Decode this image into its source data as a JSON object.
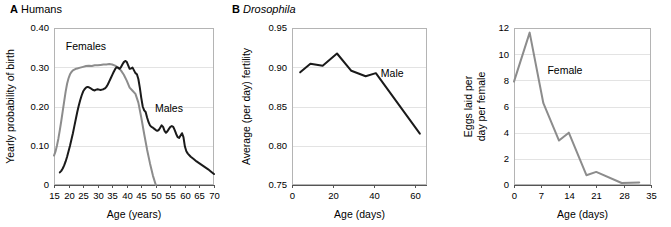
{
  "figure": {
    "panels": [
      {
        "letter": "A",
        "title": "Humans",
        "title_italic": false
      },
      {
        "letter": "B",
        "title": "Drosophila",
        "title_italic": true
      }
    ]
  },
  "chart_data": [
    {
      "id": "humans",
      "type": "line",
      "panel_letter": "A",
      "title": "Humans",
      "xlabel": "Age (years)",
      "ylabel": "Yearly probability of birth",
      "xlim": [
        15,
        70
      ],
      "ylim": [
        0,
        0.4
      ],
      "xticks": [
        15,
        20,
        25,
        30,
        35,
        40,
        45,
        50,
        55,
        60,
        65,
        70
      ],
      "xtick_labels": [
        "15",
        "20",
        "25",
        "30",
        "35",
        "40",
        "45",
        "50",
        "55",
        "60",
        "65",
        "70"
      ],
      "yticks": [
        0,
        0.1,
        0.2,
        0.3,
        0.4
      ],
      "ytick_labels": [
        "0",
        "0.10",
        "0.20",
        "0.30",
        "0.40"
      ],
      "grid": "horizontal",
      "legend_position": "inline-annotation",
      "series": [
        {
          "name": "Females",
          "color": "#8c8c8c",
          "label_x": 26.0,
          "label_y": 0.345,
          "x": [
            15.0,
            15.5,
            16.0,
            16.5,
            17.0,
            17.5,
            18.0,
            18.5,
            19.0,
            19.5,
            20.0,
            20.5,
            21.0,
            21.5,
            22.0,
            22.5,
            23.0,
            24.0,
            25.0,
            26.0,
            27.0,
            28.0,
            29.0,
            30.0,
            31.0,
            32.0,
            33.0,
            34.0,
            35.0,
            36.0,
            37.0,
            38.0,
            39.0,
            40.0,
            41.0,
            42.0,
            43.0,
            44.0,
            45.0,
            46.0,
            47.0,
            48.0,
            49.0,
            50.0
          ],
          "y": [
            0.075,
            0.085,
            0.1,
            0.118,
            0.14,
            0.163,
            0.188,
            0.213,
            0.238,
            0.258,
            0.272,
            0.282,
            0.288,
            0.292,
            0.294,
            0.296,
            0.297,
            0.299,
            0.301,
            0.303,
            0.304,
            0.303,
            0.305,
            0.305,
            0.306,
            0.307,
            0.307,
            0.308,
            0.307,
            0.304,
            0.299,
            0.292,
            0.281,
            0.266,
            0.248,
            0.24,
            0.232,
            0.21,
            0.172,
            0.13,
            0.09,
            0.055,
            0.024,
            0.0
          ]
        },
        {
          "name": "Males",
          "color": "#1a1a1a",
          "label_x": 54.5,
          "label_y": 0.185,
          "x": [
            17.0,
            17.5,
            18.0,
            18.5,
            19.0,
            19.5,
            20.0,
            20.5,
            21.0,
            21.5,
            22.0,
            22.5,
            23.0,
            23.5,
            24.0,
            24.5,
            25.0,
            25.5,
            26.0,
            26.5,
            27.0,
            27.5,
            28.0,
            28.5,
            29.0,
            29.5,
            30.0,
            30.5,
            31.0,
            31.5,
            32.0,
            32.5,
            33.0,
            33.5,
            34.0,
            34.5,
            35.0,
            35.5,
            36.0,
            36.5,
            37.0,
            37.5,
            38.0,
            38.5,
            39.0,
            39.5,
            40.0,
            40.5,
            41.0,
            41.5,
            42.0,
            42.5,
            43.0,
            43.5,
            44.0,
            44.5,
            45.0,
            45.5,
            46.0,
            46.5,
            47.0,
            47.5,
            48.0,
            48.5,
            49.0,
            49.5,
            50.0,
            50.5,
            51.0,
            51.5,
            52.0,
            52.5,
            53.0,
            53.5,
            54.0,
            54.5,
            55.0,
            55.5,
            56.0,
            56.5,
            57.0,
            57.5,
            58.0,
            58.5,
            59.0,
            59.5,
            60.0,
            60.5,
            61.0,
            62.0,
            63.0,
            64.0,
            65.0,
            66.0,
            67.0,
            68.0,
            69.0,
            70.0
          ],
          "y": [
            0.032,
            0.036,
            0.042,
            0.05,
            0.06,
            0.072,
            0.086,
            0.1,
            0.116,
            0.132,
            0.15,
            0.168,
            0.186,
            0.202,
            0.216,
            0.228,
            0.238,
            0.244,
            0.248,
            0.25,
            0.249,
            0.247,
            0.244,
            0.242,
            0.241,
            0.243,
            0.244,
            0.243,
            0.242,
            0.243,
            0.244,
            0.246,
            0.25,
            0.256,
            0.264,
            0.272,
            0.28,
            0.288,
            0.295,
            0.3,
            0.299,
            0.296,
            0.3,
            0.307,
            0.313,
            0.316,
            0.314,
            0.305,
            0.296,
            0.297,
            0.299,
            0.292,
            0.285,
            0.282,
            0.27,
            0.248,
            0.222,
            0.2,
            0.19,
            0.186,
            0.172,
            0.16,
            0.152,
            0.148,
            0.146,
            0.143,
            0.14,
            0.138,
            0.14,
            0.146,
            0.152,
            0.148,
            0.138,
            0.133,
            0.137,
            0.143,
            0.148,
            0.15,
            0.148,
            0.14,
            0.13,
            0.122,
            0.12,
            0.126,
            0.132,
            0.122,
            0.098,
            0.086,
            0.08,
            0.072,
            0.066,
            0.06,
            0.055,
            0.05,
            0.045,
            0.04,
            0.034,
            0.028
          ]
        }
      ]
    },
    {
      "id": "drosophila-male",
      "type": "line",
      "panel_letter": "B",
      "title": "Drosophila",
      "xlabel": "Age (days)",
      "ylabel": "Average (per day) fertility",
      "xlim": [
        0,
        66
      ],
      "ylim": [
        0.75,
        0.95
      ],
      "xticks": [
        0,
        20,
        40,
        60
      ],
      "xtick_labels": [
        "0",
        "20",
        "40",
        "60"
      ],
      "yticks": [
        0.75,
        0.8,
        0.85,
        0.9,
        0.95
      ],
      "ytick_labels": [
        "0.75",
        "0.80",
        "0.85",
        "0.90",
        "0.95"
      ],
      "grid": "horizontal",
      "legend_position": "inline-annotation",
      "series": [
        {
          "name": "Male",
          "color": "#1a1a1a",
          "label_x": 49.0,
          "label_y": 0.888,
          "x": [
            4.0,
            9.0,
            15.0,
            22.0,
            29.0,
            36.0,
            41.0,
            62.5
          ],
          "y": [
            0.8935,
            0.9045,
            0.902,
            0.9175,
            0.8955,
            0.8885,
            0.8925,
            0.8155
          ]
        }
      ]
    },
    {
      "id": "drosophila-female",
      "type": "line",
      "panel_letter": "",
      "title": "",
      "xlabel": "Age (days)",
      "ylabel": "Eggs laid per day per female",
      "ylabel_lines": [
        "Eggs laid per",
        "day per female"
      ],
      "xlim": [
        0,
        35
      ],
      "ylim": [
        0,
        12
      ],
      "xticks": [
        0,
        7,
        14,
        21,
        28,
        35
      ],
      "xtick_labels": [
        "0",
        "7",
        "14",
        "21",
        "28",
        "35"
      ],
      "yticks": [
        0,
        2,
        4,
        6,
        8,
        10,
        12
      ],
      "ytick_labels": [
        "0",
        "2",
        "4",
        "6",
        "8",
        "10",
        "12"
      ],
      "grid": "horizontal",
      "legend_position": "inline-annotation",
      "series": [
        {
          "name": "Female",
          "color": "#8c8c8c",
          "label_x": 13.0,
          "label_y": 8.5,
          "x": [
            0.0,
            4.0,
            7.5,
            11.5,
            14.0,
            18.5,
            21.0,
            27.5,
            32.0
          ],
          "y": [
            7.9,
            11.65,
            6.25,
            3.4,
            4.0,
            0.75,
            1.0,
            0.15,
            0.2
          ]
        }
      ]
    }
  ]
}
